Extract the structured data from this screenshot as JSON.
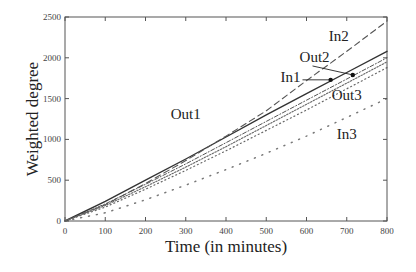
{
  "chart_data": {
    "type": "line",
    "title": "",
    "xlabel": "Time (in minutes)",
    "ylabel": "Weighted degree",
    "xlim": [
      0,
      800
    ],
    "ylim": [
      0,
      2500
    ],
    "xticks": [
      0,
      100,
      200,
      300,
      400,
      500,
      600,
      700,
      800
    ],
    "yticks": [
      0,
      500,
      1000,
      1500,
      2000,
      2500
    ],
    "grid": false,
    "legend": "inline annotations",
    "x": [
      0,
      100,
      200,
      300,
      400,
      500,
      600,
      700,
      800
    ],
    "series": [
      {
        "name": "Out1",
        "style": "solid",
        "values": [
          0,
          240,
          500,
          760,
          1030,
          1300,
          1560,
          1820,
          2080
        ]
      },
      {
        "name": "In2",
        "style": "dashed",
        "values": [
          0,
          200,
          460,
          740,
          1040,
          1350,
          1720,
          2080,
          2450
        ]
      },
      {
        "name": "Out2",
        "style": "dash-dot",
        "values": [
          0,
          210,
          450,
          700,
          960,
          1220,
          1480,
          1740,
          2000
        ]
      },
      {
        "name": "In1",
        "style": "dotted-dense",
        "values": [
          0,
          190,
          420,
          660,
          910,
          1170,
          1430,
          1690,
          1950
        ]
      },
      {
        "name": "Out3",
        "style": "dotted",
        "values": [
          0,
          170,
          390,
          620,
          860,
          1110,
          1360,
          1620,
          1880
        ]
      },
      {
        "name": "In3",
        "style": "sparse-dot",
        "values": [
          0,
          100,
          260,
          440,
          630,
          830,
          1040,
          1270,
          1500
        ]
      }
    ],
    "annotations": [
      {
        "text": "Out1",
        "x": 300,
        "y": 1250
      },
      {
        "text": "In2",
        "x": 680,
        "y": 2200
      },
      {
        "text": "Out2",
        "x": 620,
        "y": 1950
      },
      {
        "text": "In1",
        "x": 560,
        "y": 1700
      },
      {
        "text": "Out3",
        "x": 700,
        "y": 1480
      },
      {
        "text": "In3",
        "x": 700,
        "y": 1000
      }
    ]
  }
}
